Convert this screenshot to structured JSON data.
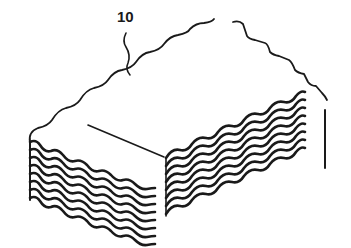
{
  "figure": {
    "reference_numeral": "10",
    "sheet_count": 8,
    "line_color": "#1a1a1a",
    "background": "#ffffff"
  }
}
